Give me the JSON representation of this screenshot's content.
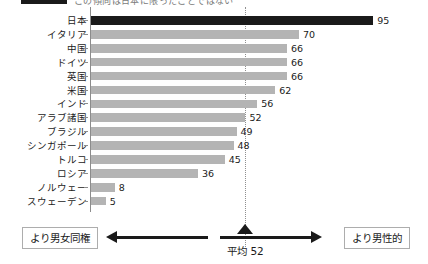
{
  "header": {
    "cut_off_text": "この傾向は日本に限ったことではない"
  },
  "chart_data": {
    "type": "bar",
    "orientation": "horizontal",
    "title": "",
    "xlabel": "",
    "ylabel": "",
    "xlim": [
      0,
      100
    ],
    "grid": false,
    "legend": null,
    "mean_value": 52,
    "mean_label": "平均 52",
    "highlight_category": "日本",
    "categories": [
      "日本",
      "イタリア",
      "中国",
      "ドイツ",
      "英国",
      "米国",
      "インド",
      "アラブ諸国",
      "ブラジル",
      "シンガポール",
      "トルコ",
      "ロシア",
      "ノルウェー",
      "スウェーデン"
    ],
    "values": [
      95,
      70,
      66,
      66,
      66,
      62,
      56,
      52,
      49,
      48,
      45,
      36,
      8,
      5
    ],
    "value_labels": [
      "95",
      "70",
      "66",
      "66",
      "66",
      "62",
      "56",
      "52",
      "49",
      "48",
      "45",
      "36",
      "8",
      "5"
    ],
    "colors": {
      "bar": "#b4b4b4",
      "highlight_bar": "#1a1a1a",
      "axis": "#8c8c8c",
      "mean_line": "#8f8f8f",
      "text": "#1a1a1a",
      "box_border": "#adadad"
    }
  },
  "footer": {
    "left_label": "より男女同権",
    "right_label": "より男性的",
    "center_label": "平均 52"
  }
}
